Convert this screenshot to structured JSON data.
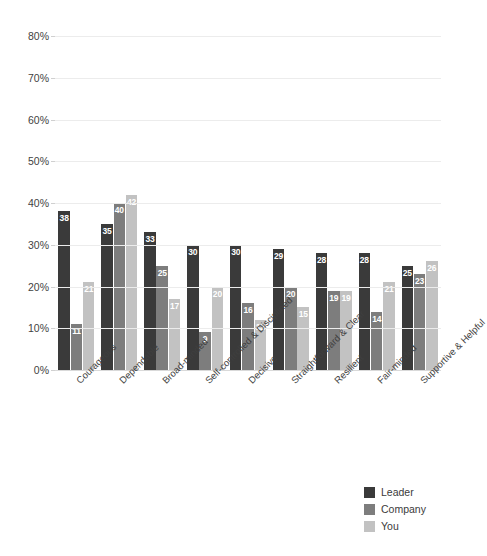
{
  "chart_data": {
    "type": "bar",
    "title": "",
    "subtitle": "",
    "xlabel": "",
    "ylabel": "",
    "ylim": [
      0,
      80
    ],
    "ytick_labels": [
      "0%",
      "10%",
      "20%",
      "30%",
      "40%",
      "50%",
      "60%",
      "70%",
      "80%"
    ],
    "ytick_values": [
      0,
      10,
      20,
      30,
      40,
      50,
      60,
      70,
      80
    ],
    "grid": true,
    "legend_position": "bottom-right",
    "value_suffix": "",
    "categories": [
      "Courageous",
      "Dependable",
      "Broad-minded",
      "Self-controlled & Disciplined",
      "Decisive",
      "Straightforward & Clear",
      "Resilient",
      "Fair-minded",
      "Supportive & Helpful"
    ],
    "series": [
      {
        "name": "Leader",
        "color": "#3a3a3a",
        "values": [
          38,
          35,
          33,
          30,
          30,
          29,
          28,
          28,
          25
        ]
      },
      {
        "name": "Company",
        "color": "#7d7d7d",
        "values": [
          11,
          40,
          25,
          9,
          16,
          20,
          19,
          14,
          23
        ]
      },
      {
        "name": "You",
        "color": "#c2c2c2",
        "values": [
          21,
          42,
          17,
          20,
          12,
          15,
          19,
          21,
          26
        ]
      }
    ]
  },
  "legend": {
    "items": [
      {
        "label": "Leader",
        "color": "#3a3a3a"
      },
      {
        "label": "Company",
        "color": "#7d7d7d"
      },
      {
        "label": "You",
        "color": "#c2c2c2"
      }
    ]
  }
}
